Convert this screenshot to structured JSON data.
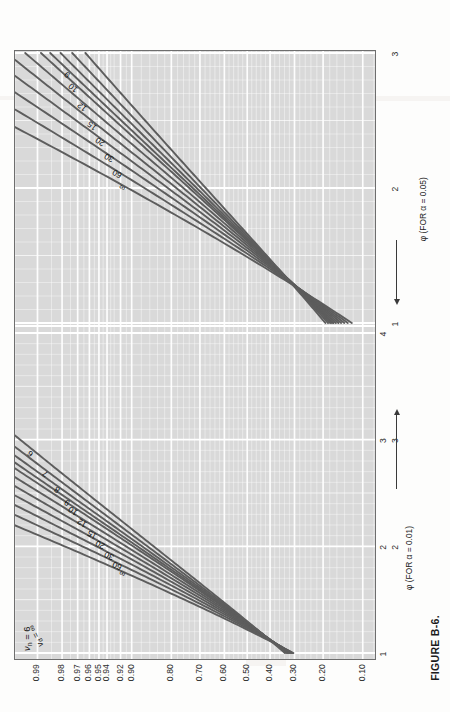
{
  "caption": "FIGURE B-6.",
  "chart_data": {
    "type": "line",
    "title": "FIGURE B-6.",
    "ylabel": "POWER 1 − β",
    "ylabel_plain": "POWER 1 - beta",
    "xlabel_primary": "φ (FOR α = 0.05)",
    "xlabel_secondary": "φ (FOR α = 0.01)",
    "numerator_df_label": "νₙ = 6",
    "numerator_df_value": 6,
    "denominator_df_label": "νᵈ",
    "panel_alpha_labels": [
      "α = 0.05",
      "α = 0.01"
    ],
    "alphas": [
      0.05,
      0.01
    ],
    "grid": true,
    "legend_position": "in-plot curve labels",
    "y_ticks": [
      "0.99",
      "0.98",
      "0.97",
      "0.96",
      "0.95",
      "0.94",
      "0.92",
      "0.90",
      "0.80",
      "0.70",
      "0.60",
      "0.50",
      "0.40",
      "0.30",
      "0.20",
      "0.10"
    ],
    "y_values": [
      0.99,
      0.98,
      0.97,
      0.96,
      0.95,
      0.94,
      0.92,
      0.9,
      0.8,
      0.7,
      0.6,
      0.5,
      0.4,
      0.3,
      0.2,
      0.1
    ],
    "y_tick_frac": [
      0.022,
      0.117,
      0.187,
      0.243,
      0.29,
      0.331,
      0.402,
      0.462,
      0.705,
      0.84,
      0.925,
      0.985,
      1.032,
      1.07,
      1.103,
      1.132
    ],
    "x_ticks_alpha05": [
      "1",
      "2",
      "3",
      "4"
    ],
    "x_ticks_alpha01": [
      "1",
      "2",
      "3"
    ],
    "xlim_alpha05": [
      1,
      4
    ],
    "xlim_alpha01": [
      1,
      3
    ],
    "series_labels": [
      "∞",
      "60",
      "30",
      "20",
      "15",
      "12",
      "10",
      "9",
      "8",
      "7",
      "6"
    ],
    "series": [
      {
        "name": "∞",
        "nu_d": "inf"
      },
      {
        "name": "60",
        "nu_d": 60
      },
      {
        "name": "30",
        "nu_d": 30
      },
      {
        "name": "20",
        "nu_d": 20
      },
      {
        "name": "15",
        "nu_d": 15
      },
      {
        "name": "12",
        "nu_d": 12
      },
      {
        "name": "10",
        "nu_d": 10
      },
      {
        "name": "9",
        "nu_d": 9
      },
      {
        "name": "8",
        "nu_d": 8
      },
      {
        "name": "7",
        "nu_d": 7
      },
      {
        "name": "6",
        "nu_d": 6
      }
    ]
  }
}
